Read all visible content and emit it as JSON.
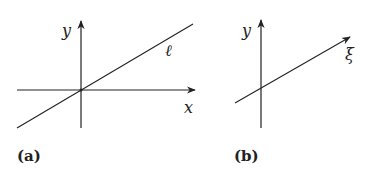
{
  "panels": [
    {
      "caption": "(a)",
      "axes": {
        "x_label": "x",
        "y_label": "y"
      },
      "line_label": "ℓ"
    },
    {
      "caption": "(b)",
      "axes": {
        "y_label": "y"
      },
      "vector_label": "ξ"
    }
  ],
  "colors": {
    "stroke": "#222222",
    "background": "#ffffff"
  }
}
